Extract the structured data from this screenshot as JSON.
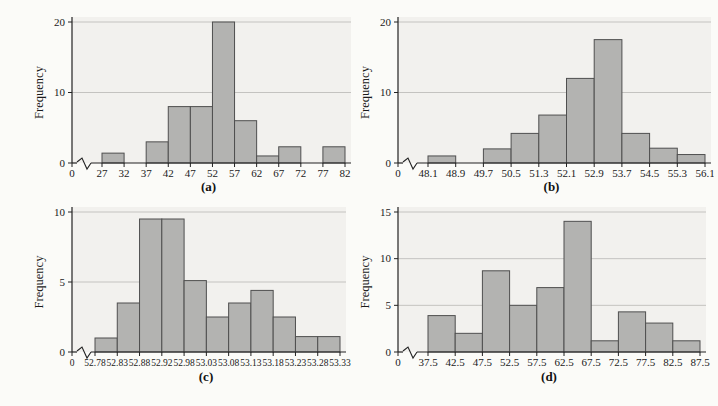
{
  "style": {
    "page_bg": "#fbfbf8",
    "plot_bg": "#f2f1ee",
    "bar_fill": "#b3b3b1",
    "bar_stroke": "#4f4f4f",
    "gridline": "#c4c3c0",
    "axis": "#222222",
    "text": "#1a1a1a"
  },
  "chart_data": [
    {
      "id": "a",
      "type": "bar",
      "subtype": "histogram",
      "caption": "(a)",
      "ylabel": "Frequency",
      "origin_label": "0",
      "axis_break": true,
      "grid": "horizontal-at-yticks",
      "legend": "none",
      "bin_edges": [
        "27",
        "32",
        "37",
        "42",
        "47",
        "52",
        "57",
        "62",
        "67",
        "72",
        "77",
        "82"
      ],
      "values": [
        1.4,
        0,
        3,
        8,
        8,
        20,
        6,
        1,
        2.3,
        0,
        2.3
      ],
      "yticks": [
        0,
        10,
        20
      ],
      "ylim": [
        0,
        20
      ]
    },
    {
      "id": "b",
      "type": "bar",
      "subtype": "histogram",
      "caption": "(b)",
      "ylabel": "Frequency",
      "origin_label": "0",
      "axis_break": true,
      "grid": "horizontal-at-yticks",
      "legend": "none",
      "bin_edges": [
        "48.1",
        "48.9",
        "49.7",
        "50.5",
        "51.3",
        "52.1",
        "52.9",
        "53.7",
        "54.5",
        "55.3",
        "56.1"
      ],
      "values": [
        1,
        0,
        2,
        4.2,
        6.8,
        12,
        17.5,
        4.2,
        2.1,
        1.2
      ],
      "yticks": [
        0,
        10,
        20
      ],
      "ylim": [
        0,
        20
      ]
    },
    {
      "id": "c",
      "type": "bar",
      "subtype": "histogram",
      "caption": "(c)",
      "ylabel": "Frequency",
      "origin_label": "0",
      "axis_break": true,
      "grid": "horizontal-at-yticks",
      "legend": "none",
      "bin_edges": [
        "52.78",
        "52.83",
        "52.88",
        "52.92",
        "52.98",
        "53.03",
        "53.08",
        "53.13",
        "53.18",
        "53.23",
        "53.28",
        "53.33"
      ],
      "values": [
        1,
        3.5,
        9.5,
        9.5,
        5.1,
        2.5,
        3.5,
        4.4,
        2.5,
        1.1,
        1.1
      ],
      "yticks": [
        0,
        5,
        10
      ],
      "ylim": [
        0,
        10
      ]
    },
    {
      "id": "d",
      "type": "bar",
      "subtype": "histogram",
      "caption": "(d)",
      "ylabel": "Frequency",
      "origin_label": "0",
      "axis_break": true,
      "grid": "horizontal-at-yticks",
      "legend": "none",
      "bin_edges": [
        "37.5",
        "42.5",
        "47.5",
        "52.5",
        "57.5",
        "62.5",
        "67.5",
        "72.5",
        "77.5",
        "82.5",
        "87.5"
      ],
      "values": [
        3.9,
        2,
        8.7,
        5,
        6.9,
        14,
        1.2,
        4.3,
        3.1,
        1.2
      ],
      "yticks": [
        0,
        5,
        10,
        15
      ],
      "ylim": [
        0,
        15
      ]
    }
  ]
}
